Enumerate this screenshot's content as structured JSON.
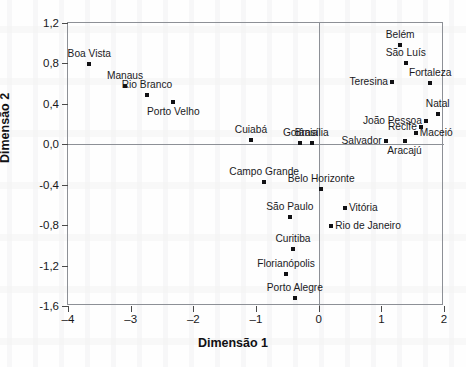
{
  "chart_data": {
    "type": "scatter",
    "title": "",
    "xlabel": "Dimensão 1",
    "ylabel": "Dimensão 2",
    "xlim": [
      -4,
      2
    ],
    "ylim": [
      -1.6,
      1.2
    ],
    "xticks": [
      "-4",
      "-3",
      "-2",
      "-1",
      "0",
      "1",
      "2"
    ],
    "xtick_values": [
      -4,
      -3,
      -2,
      -1,
      0,
      1,
      2
    ],
    "yticks": [
      "1,2",
      "0,8",
      "0,4",
      "0,0",
      "-0,4",
      "-0,8",
      "-1,2",
      "-1,6"
    ],
    "ytick_values": [
      1.2,
      0.8,
      0.4,
      0.0,
      -0.4,
      -0.8,
      -1.2,
      -1.6
    ],
    "grid": false,
    "legend": false,
    "zero_lines": {
      "vertical_x": 0,
      "horizontal_y": 0
    },
    "points": [
      {
        "label": "Boa Vista",
        "x": -3.66,
        "y": 0.79,
        "label_pos": "c"
      },
      {
        "label": "Manaus",
        "x": -3.09,
        "y": 0.58,
        "label_pos": "c"
      },
      {
        "label": "Rio Branco",
        "x": -2.74,
        "y": 0.49,
        "label_pos": "c"
      },
      {
        "label": "Porto Velho",
        "x": -2.32,
        "y": 0.42,
        "label_pos": "bc"
      },
      {
        "label": "Cuiabá",
        "x": -1.08,
        "y": 0.04,
        "label_pos": "c"
      },
      {
        "label": "Goiânia",
        "x": -0.29,
        "y": 0.01,
        "label_pos": "c"
      },
      {
        "label": "Brasília",
        "x": -0.11,
        "y": 0.01,
        "label_pos": "c"
      },
      {
        "label": "Belém",
        "x": 1.3,
        "y": 0.98,
        "label_pos": "c"
      },
      {
        "label": "São Luís",
        "x": 1.39,
        "y": 0.8,
        "label_pos": "c"
      },
      {
        "label": "Teresina",
        "x": 1.17,
        "y": 0.62,
        "label_pos": "l"
      },
      {
        "label": "Fortaleza",
        "x": 1.78,
        "y": 0.61,
        "label_pos": "c"
      },
      {
        "label": "Natal",
        "x": 1.9,
        "y": 0.3,
        "label_pos": "c"
      },
      {
        "label": "João Pessoa",
        "x": 1.71,
        "y": 0.23,
        "label_pos": "l"
      },
      {
        "label": "Recife",
        "x": 1.63,
        "y": 0.17,
        "label_pos": "l"
      },
      {
        "label": "Maceió",
        "x": 1.55,
        "y": 0.11,
        "label_pos": "r"
      },
      {
        "label": "Salvador",
        "x": 1.07,
        "y": 0.03,
        "label_pos": "l"
      },
      {
        "label": "Aracajú",
        "x": 1.37,
        "y": 0.03,
        "label_pos": "bc"
      },
      {
        "label": "Campo Grande",
        "x": -0.87,
        "y": -0.37,
        "label_pos": "c"
      },
      {
        "label": "Belo Horizonte",
        "x": 0.04,
        "y": -0.44,
        "label_pos": "c"
      },
      {
        "label": "Vitória",
        "x": 0.42,
        "y": -0.63,
        "label_pos": "r"
      },
      {
        "label": "São Paulo",
        "x": -0.46,
        "y": -0.72,
        "label_pos": "c"
      },
      {
        "label": "Rio de Janeiro",
        "x": 0.2,
        "y": -0.81,
        "label_pos": "r"
      },
      {
        "label": "Curitiba",
        "x": -0.41,
        "y": -1.04,
        "label_pos": "c"
      },
      {
        "label": "Florianópolis",
        "x": -0.52,
        "y": -1.28,
        "label_pos": "c"
      },
      {
        "label": "Porto Alegre",
        "x": -0.38,
        "y": -1.52,
        "label_pos": "c"
      }
    ]
  }
}
